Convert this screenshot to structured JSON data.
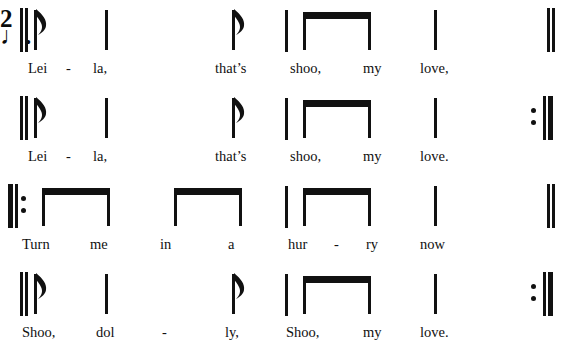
{
  "document": {
    "kind": "rhythm-notation-score",
    "time_signature": {
      "numerator": "2",
      "denominator": "♩."
    },
    "systems": [
      {
        "id": "system-1",
        "start_barline": "double",
        "end_barline": "double",
        "lyrics": [
          {
            "text": "Lei",
            "x": 28
          },
          {
            "text": "-",
            "x": 66
          },
          {
            "text": "la,",
            "x": 93
          },
          {
            "text": "that’s",
            "x": 215
          },
          {
            "text": "shoo,",
            "x": 290
          },
          {
            "text": "my",
            "x": 363
          },
          {
            "text": "love,",
            "x": 420
          }
        ]
      },
      {
        "id": "system-2",
        "start_barline": "double",
        "end_barline": "repeat-end",
        "lyrics": [
          {
            "text": "Lei",
            "x": 28
          },
          {
            "text": "-",
            "x": 66
          },
          {
            "text": "la,",
            "x": 93
          },
          {
            "text": "that’s",
            "x": 215
          },
          {
            "text": "shoo,",
            "x": 290
          },
          {
            "text": "my",
            "x": 363
          },
          {
            "text": "love.",
            "x": 420
          }
        ]
      },
      {
        "id": "system-3",
        "start_barline": "repeat-begin",
        "end_barline": "double",
        "lyrics": [
          {
            "text": "Turn",
            "x": 22
          },
          {
            "text": "me",
            "x": 90
          },
          {
            "text": "in",
            "x": 160
          },
          {
            "text": "a",
            "x": 228
          },
          {
            "text": "hur",
            "x": 288
          },
          {
            "text": "-",
            "x": 334
          },
          {
            "text": "ry",
            "x": 366
          },
          {
            "text": "now",
            "x": 420
          }
        ]
      },
      {
        "id": "system-4",
        "start_barline": "double",
        "end_barline": "repeat-end",
        "lyrics": [
          {
            "text": "Shoo,",
            "x": 22
          },
          {
            "text": "dol",
            "x": 96
          },
          {
            "text": "-",
            "x": 162
          },
          {
            "text": "ly,",
            "x": 225
          },
          {
            "text": "Shoo,",
            "x": 286
          },
          {
            "text": "my",
            "x": 363
          },
          {
            "text": "love.",
            "x": 420
          }
        ]
      }
    ]
  },
  "colors": {
    "ink": "#111111",
    "page": "#ffffff"
  }
}
